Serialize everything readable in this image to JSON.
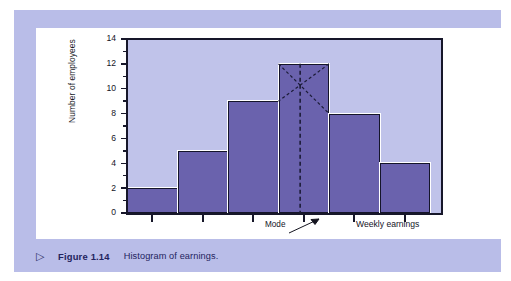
{
  "figure": {
    "marker": "▷",
    "number": "Figure 1.14",
    "caption": "Histogram of earnings."
  },
  "colors": {
    "panel_background": "#b9bde8",
    "inner_panel": "#ffffff",
    "plot_background": "#c0c3ea",
    "bar_fill": "#6a62ad",
    "bar_outline": "#15152a",
    "axis": "#17172a",
    "caption_text": "#23235e"
  },
  "annotations": {
    "mode_label": "Mode"
  },
  "chart_data": {
    "type": "bar",
    "title": "",
    "subtitle": "",
    "xlabel": "Weekly earnings",
    "ylabel": "Number of employees",
    "categories": [
      "1",
      "2",
      "3",
      "4",
      "5",
      "6"
    ],
    "values": [
      2,
      5,
      9,
      12,
      8,
      4
    ],
    "ylim": [
      0,
      14
    ],
    "ytick_labels": [
      "0",
      "2",
      "4",
      "6",
      "8",
      "10",
      "12",
      "14"
    ],
    "ytick_values": [
      0,
      2,
      4,
      6,
      8,
      10,
      12,
      14
    ],
    "yminor_step": 1,
    "grid": false,
    "legend": null,
    "annotations": [
      {
        "text": "Mode",
        "type": "arrow-callout",
        "points_to_bar_index": 3,
        "description": "Dashed vertical line from the intersection of the cross-diagonals in the modal bar down to the x-axis"
      }
    ],
    "mode_bar_index": 3,
    "mode_bar_value": 12
  }
}
